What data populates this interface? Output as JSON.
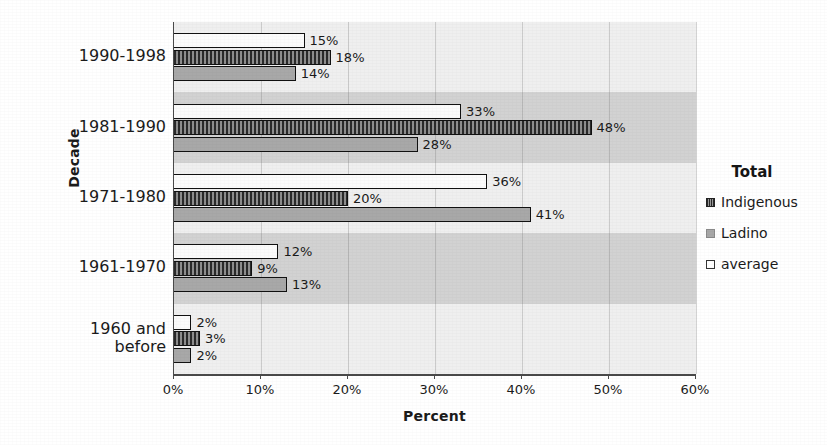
{
  "chart_data": {
    "type": "bar",
    "orientation": "horizontal",
    "title": "",
    "xlabel": "Percent",
    "ylabel": "Decade",
    "xlim": [
      0,
      60
    ],
    "xticks": [
      "0%",
      "10%",
      "20%",
      "30%",
      "40%",
      "50%",
      "60%"
    ],
    "xtick_values": [
      0,
      10,
      20,
      30,
      40,
      50,
      60
    ],
    "grid": true,
    "legend_position": "right",
    "legend_title": "Total",
    "categories": [
      "1990-1998",
      "1981-1990",
      "1971-1980",
      "1961-1970",
      "1960 and before"
    ],
    "series": [
      {
        "name": "average",
        "fill": "white",
        "values": [
          15,
          33,
          36,
          12,
          2
        ],
        "labels": [
          "15%",
          "33%",
          "36%",
          "12%",
          "2%"
        ]
      },
      {
        "name": "Indigenous",
        "fill": "hatched-dark",
        "values": [
          18,
          48,
          20,
          9,
          3
        ],
        "labels": [
          "18%",
          "48%",
          "20%",
          "9%",
          "3%"
        ]
      },
      {
        "name": "Ladino",
        "fill": "solid-gray",
        "values": [
          14,
          28,
          41,
          13,
          2
        ],
        "labels": [
          "14%",
          "28%",
          "41%",
          "13%",
          "2%"
        ]
      }
    ],
    "colors": {
      "indigenous": "#555555",
      "ladino": "#a8a8a8",
      "average": "#fbfbfb",
      "plot_background": "#d2d2d2",
      "band_background": "#efefef",
      "axis": "#4a4a4a",
      "text": "#1b1b1b"
    }
  },
  "legend": {
    "title": "Total",
    "items": [
      {
        "label": "Indigenous"
      },
      {
        "label": "Ladino"
      },
      {
        "label": "average"
      }
    ]
  },
  "axes": {
    "x_title": "Percent",
    "y_title": "Decade",
    "x_tick_labels": [
      "0%",
      "10%",
      "20%",
      "30%",
      "40%",
      "50%",
      "60%"
    ],
    "y_tick_labels": [
      "1990-1998",
      "1981-1990",
      "1971-1980",
      "1961-1970",
      "1960 and before"
    ]
  }
}
